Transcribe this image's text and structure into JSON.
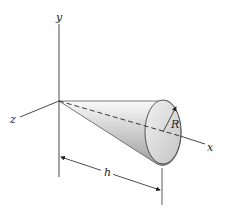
{
  "diagram": {
    "axes": {
      "x_label": "x",
      "y_label": "y",
      "z_label": "z"
    },
    "dimensions": {
      "radius_label": "R",
      "height_label": "h"
    },
    "colors": {
      "line": "#333333",
      "cone_light": "#f4f4f4",
      "cone_dark": "#8e8e8e",
      "base_light": "#e8e8e8",
      "base_dark": "#bdbdbd"
    }
  }
}
